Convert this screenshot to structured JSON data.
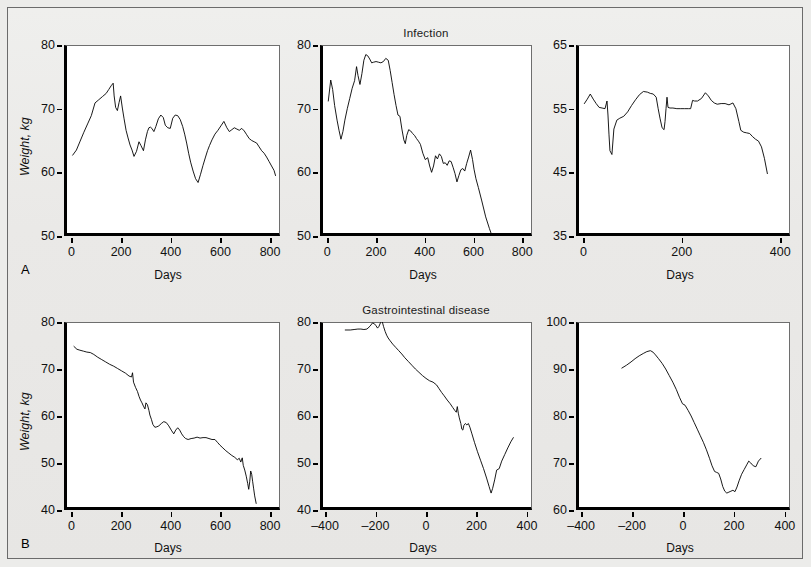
{
  "figure": {
    "background_color": "#ececea",
    "border_color": "#6b6b6b",
    "row_labels": [
      {
        "id": "A",
        "text": "A"
      },
      {
        "id": "B",
        "text": "B"
      }
    ]
  },
  "axis_titles": {
    "x": "Days",
    "y": "Weight, kg"
  },
  "chart_data": [
    {
      "id": "panel-a1",
      "type": "line",
      "title": "",
      "row": "A",
      "xlabel": "Days",
      "ylabel": "Weight, kg",
      "xlim": [
        -30,
        840
      ],
      "ylim": [
        50,
        80
      ],
      "xticks": [
        0,
        200,
        400,
        600,
        800
      ],
      "yticks": [
        50,
        60,
        70,
        80
      ],
      "grid": false,
      "legend": "none",
      "series": [
        {
          "name": "weight",
          "x": [
            5,
            20,
            35,
            50,
            65,
            80,
            95,
            110,
            125,
            140,
            150,
            160,
            168,
            172,
            178,
            185,
            192,
            198,
            205,
            212,
            220,
            228,
            236,
            244,
            252,
            262,
            272,
            280,
            290,
            298,
            306,
            312,
            318,
            324,
            332,
            340,
            350,
            360,
            370,
            378,
            388,
            398,
            408,
            418,
            428,
            438,
            448,
            456,
            464,
            472,
            480,
            490,
            500,
            510,
            520,
            530,
            540,
            548,
            556,
            566,
            578,
            590,
            602,
            614,
            626,
            636,
            646,
            656,
            666,
            676,
            686,
            696,
            706,
            716,
            726,
            736,
            746,
            756,
            766,
            776,
            786,
            796,
            806,
            816,
            822
          ],
          "y": [
            62.7,
            63.5,
            64.9,
            66.3,
            67.6,
            68.9,
            70.9,
            71.4,
            71.9,
            72.4,
            73.0,
            73.6,
            74.0,
            72.0,
            70.2,
            69.7,
            71.0,
            72.0,
            70.1,
            68.4,
            66.6,
            65.4,
            64.3,
            63.5,
            62.5,
            63.3,
            64.8,
            64.2,
            63.4,
            65.1,
            66.4,
            67.0,
            67.1,
            66.9,
            66.4,
            67.2,
            68.4,
            69.0,
            68.6,
            67.4,
            67.0,
            66.9,
            68.5,
            69.0,
            68.9,
            68.3,
            67.2,
            66.0,
            64.6,
            63.0,
            61.6,
            60.2,
            59.0,
            58.4,
            59.7,
            61.1,
            62.4,
            63.4,
            64.2,
            65.1,
            66.0,
            66.6,
            67.3,
            68.0,
            67.0,
            66.4,
            66.7,
            67.0,
            66.8,
            66.6,
            66.9,
            66.5,
            65.9,
            65.3,
            65.0,
            64.8,
            64.6,
            64.0,
            63.4,
            63.0,
            62.4,
            61.7,
            61.0,
            60.3,
            59.5
          ]
        }
      ]
    },
    {
      "id": "panel-a2",
      "type": "line",
      "title": "Infection",
      "row": "A",
      "xlabel": "Days",
      "ylabel": "",
      "xlim": [
        -30,
        840
      ],
      "ylim": [
        50,
        80
      ],
      "xticks": [
        0,
        200,
        400,
        600,
        800
      ],
      "yticks": [
        50,
        60,
        70,
        80
      ],
      "grid": false,
      "legend": "none",
      "series": [
        {
          "name": "weight",
          "x": [
            4,
            14,
            22,
            30,
            40,
            48,
            56,
            64,
            72,
            82,
            92,
            102,
            112,
            120,
            126,
            134,
            142,
            150,
            158,
            166,
            174,
            182,
            190,
            200,
            210,
            220,
            230,
            240,
            250,
            258,
            266,
            274,
            282,
            290,
            298,
            306,
            314,
            320,
            326,
            334,
            342,
            350,
            358,
            366,
            374,
            382,
            392,
            402,
            412,
            420,
            428,
            436,
            444,
            452,
            460,
            468,
            476,
            484,
            492,
            500,
            508,
            516,
            524,
            532,
            540,
            548,
            556,
            564,
            572,
            580,
            588,
            596,
            602,
            610,
            620,
            634,
            650,
            665,
            676
          ],
          "y": [
            71.2,
            74.5,
            73.0,
            70.5,
            68.2,
            66.6,
            65.2,
            66.4,
            68.2,
            70.0,
            71.6,
            73.2,
            74.4,
            76.6,
            75.2,
            73.8,
            75.5,
            77.6,
            78.5,
            78.3,
            77.8,
            77.2,
            77.3,
            77.4,
            77.3,
            77.2,
            77.4,
            77.9,
            77.6,
            76.0,
            74.1,
            72.2,
            70.5,
            69.0,
            68.8,
            66.8,
            65.1,
            64.5,
            65.8,
            66.7,
            66.5,
            66.1,
            65.8,
            65.3,
            64.9,
            64.4,
            63.0,
            62.0,
            62.3,
            61.0,
            60.0,
            61.0,
            62.6,
            62.1,
            62.9,
            62.5,
            61.4,
            61.5,
            61.1,
            61.8,
            61.7,
            60.8,
            59.8,
            58.5,
            59.5,
            60.4,
            60.6,
            60.2,
            61.4,
            62.4,
            63.5,
            62.0,
            60.5,
            59.0,
            57.6,
            55.5,
            53.0,
            51.2,
            50.0
          ]
        }
      ]
    },
    {
      "id": "panel-a3",
      "type": "line",
      "title": "",
      "row": "A",
      "xlabel": "Days",
      "ylabel": "",
      "xlim": [
        -15,
        420
      ],
      "ylim": [
        35,
        65
      ],
      "xticks": [
        0,
        200,
        400
      ],
      "yticks": [
        35,
        45,
        55,
        65
      ],
      "grid": false,
      "legend": "none",
      "series": [
        {
          "name": "weight",
          "x": [
            2,
            8,
            14,
            20,
            26,
            32,
            38,
            44,
            48,
            50,
            52,
            54,
            58,
            62,
            68,
            74,
            82,
            90,
            98,
            106,
            114,
            122,
            130,
            136,
            142,
            148,
            152,
            156,
            160,
            164,
            166,
            168,
            170,
            172,
            176,
            182,
            190,
            198,
            206,
            214,
            218,
            222,
            226,
            232,
            240,
            248,
            254,
            260,
            266,
            272,
            280,
            288,
            296,
            304,
            310,
            316,
            320,
            326,
            332,
            338,
            344,
            350,
            356,
            362,
            368,
            374
          ],
          "y": [
            55.8,
            56.5,
            57.3,
            56.5,
            55.8,
            55.2,
            55.1,
            55.0,
            56.2,
            54.0,
            51.0,
            48.4,
            47.8,
            51.8,
            53.2,
            53.5,
            53.8,
            54.5,
            55.5,
            56.4,
            57.2,
            57.7,
            57.6,
            57.4,
            57.3,
            56.8,
            55.0,
            53.4,
            52.0,
            51.7,
            53.0,
            55.0,
            56.8,
            55.2,
            55.1,
            55.1,
            55.0,
            55.0,
            55.0,
            55.0,
            55.0,
            56.3,
            56.2,
            56.2,
            56.6,
            57.5,
            57.0,
            56.3,
            55.9,
            55.7,
            55.8,
            55.8,
            55.6,
            55.9,
            55.0,
            53.0,
            51.6,
            51.3,
            51.2,
            51.1,
            50.6,
            50.2,
            49.9,
            49.0,
            47.2,
            44.8
          ]
        }
      ]
    },
    {
      "id": "panel-b1",
      "type": "line",
      "title": "",
      "row": "B",
      "xlabel": "Days",
      "ylabel": "Weight, kg",
      "xlim": [
        -30,
        840
      ],
      "ylim": [
        40,
        80
      ],
      "xticks": [
        0,
        200,
        400,
        600,
        800
      ],
      "yticks": [
        40,
        50,
        60,
        70,
        80
      ],
      "grid": false,
      "legend": "none",
      "series": [
        {
          "name": "weight",
          "x": [
            10,
            22,
            34,
            48,
            62,
            76,
            90,
            106,
            122,
            138,
            154,
            170,
            186,
            202,
            218,
            232,
            242,
            246,
            250,
            258,
            266,
            272,
            278,
            284,
            290,
            296,
            300,
            306,
            312,
            316,
            322,
            328,
            336,
            344,
            352,
            362,
            372,
            382,
            392,
            402,
            412,
            420,
            428,
            436,
            444,
            452,
            460,
            470,
            482,
            494,
            506,
            518,
            530,
            542,
            554,
            566,
            578,
            588,
            598,
            610,
            622,
            634,
            646,
            658,
            668,
            676,
            682,
            688,
            692,
            698,
            704,
            710,
            714,
            718,
            722,
            726,
            730,
            734,
            738,
            744
          ],
          "y": [
            74.8,
            74.2,
            74.0,
            73.8,
            73.6,
            73.5,
            73.1,
            72.5,
            72.0,
            71.5,
            71.0,
            70.6,
            70.1,
            69.6,
            69.1,
            68.5,
            68.3,
            69.2,
            67.2,
            66.1,
            65.2,
            64.2,
            63.4,
            62.8,
            62.1,
            61.5,
            62.8,
            62.4,
            61.2,
            60.2,
            59.3,
            58.2,
            57.6,
            57.7,
            57.9,
            58.4,
            58.8,
            58.6,
            57.9,
            57.0,
            56.2,
            57.0,
            57.5,
            57.0,
            56.2,
            55.6,
            55.2,
            55.0,
            55.2,
            55.3,
            55.5,
            55.3,
            55.4,
            55.4,
            55.2,
            55.0,
            55.0,
            54.4,
            53.8,
            53.2,
            52.6,
            52.1,
            51.6,
            51.2,
            50.7,
            51.0,
            50.2,
            51.1,
            49.5,
            48.5,
            47.2,
            45.6,
            44.4,
            46.0,
            48.3,
            47.6,
            46.0,
            44.5,
            43.0,
            41.4
          ]
        }
      ]
    },
    {
      "id": "panel-b2",
      "type": "line",
      "title": "Gastrointestinal disease",
      "row": "B",
      "xlabel": "Days",
      "ylabel": "",
      "xlim": [
        -420,
        420
      ],
      "ylim": [
        40,
        80
      ],
      "xticks": [
        -400,
        -200,
        0,
        200,
        400
      ],
      "yticks": [
        40,
        50,
        60,
        70,
        80
      ],
      "grid": false,
      "legend": "none",
      "series": [
        {
          "name": "weight",
          "x": [
            -320,
            -300,
            -285,
            -270,
            -258,
            -246,
            -234,
            -222,
            -212,
            -204,
            -198,
            -192,
            -186,
            -180,
            -174,
            -168,
            -162,
            -156,
            -150,
            -142,
            -132,
            -120,
            -108,
            -96,
            -84,
            -70,
            -56,
            -42,
            -28,
            -14,
            0,
            14,
            28,
            42,
            52,
            62,
            72,
            84,
            96,
            106,
            114,
            120,
            124,
            128,
            132,
            138,
            142,
            146,
            150,
            156,
            162,
            168,
            174,
            182,
            192,
            204,
            216,
            228,
            240,
            250,
            258,
            264,
            272,
            280,
            290,
            300,
            312,
            324,
            336,
            346
          ],
          "y": [
            78.3,
            78.3,
            78.4,
            78.5,
            78.5,
            78.4,
            78.5,
            79.1,
            79.8,
            79.6,
            79.2,
            78.7,
            79.1,
            79.9,
            80.2,
            79.0,
            78.0,
            77.2,
            76.6,
            76.0,
            75.3,
            74.6,
            73.9,
            73.2,
            72.4,
            71.6,
            70.8,
            70.0,
            69.3,
            68.6,
            68.0,
            67.5,
            67.2,
            66.6,
            65.8,
            65.0,
            64.3,
            63.4,
            62.6,
            61.8,
            61.2,
            60.8,
            62.0,
            60.6,
            59.6,
            58.4,
            57.2,
            57.0,
            58.0,
            58.4,
            58.1,
            58.4,
            57.6,
            56.2,
            54.4,
            52.4,
            50.6,
            48.8,
            46.8,
            45.0,
            43.6,
            44.6,
            46.4,
            48.5,
            48.8,
            50.4,
            51.8,
            53.2,
            54.5,
            55.4
          ]
        }
      ]
    },
    {
      "id": "panel-b3",
      "type": "line",
      "title": "",
      "row": "B",
      "xlabel": "Days",
      "ylabel": "",
      "xlim": [
        -420,
        420
      ],
      "ylim": [
        60,
        100
      ],
      "xticks": [
        -400,
        -200,
        0,
        200,
        400
      ],
      "yticks": [
        60,
        70,
        80,
        90,
        100
      ],
      "grid": false,
      "legend": "none",
      "series": [
        {
          "name": "weight",
          "x": [
            -240,
            -222,
            -204,
            -188,
            -172,
            -156,
            -142,
            -128,
            -118,
            -108,
            -96,
            -82,
            -68,
            -54,
            -40,
            -26,
            -14,
            -2,
            8,
            20,
            32,
            44,
            56,
            68,
            80,
            92,
            104,
            114,
            124,
            132,
            140,
            148,
            156,
            164,
            172,
            180,
            188,
            196,
            204,
            212,
            220,
            230,
            240,
            250,
            258,
            266,
            276,
            286,
            296,
            306
          ],
          "y": [
            90.2,
            90.8,
            91.5,
            92.2,
            92.8,
            93.3,
            93.7,
            93.9,
            93.6,
            93.0,
            92.2,
            91.2,
            90.0,
            88.6,
            87.2,
            85.6,
            84.0,
            82.6,
            82.3,
            81.2,
            80.0,
            78.6,
            77.2,
            75.8,
            74.4,
            72.8,
            71.0,
            69.4,
            68.2,
            68.0,
            67.8,
            66.6,
            65.0,
            64.0,
            63.6,
            63.8,
            64.0,
            64.2,
            63.9,
            64.9,
            66.2,
            67.6,
            68.6,
            69.6,
            70.4,
            70.0,
            69.4,
            69.2,
            70.4,
            71.0
          ]
        }
      ]
    }
  ]
}
